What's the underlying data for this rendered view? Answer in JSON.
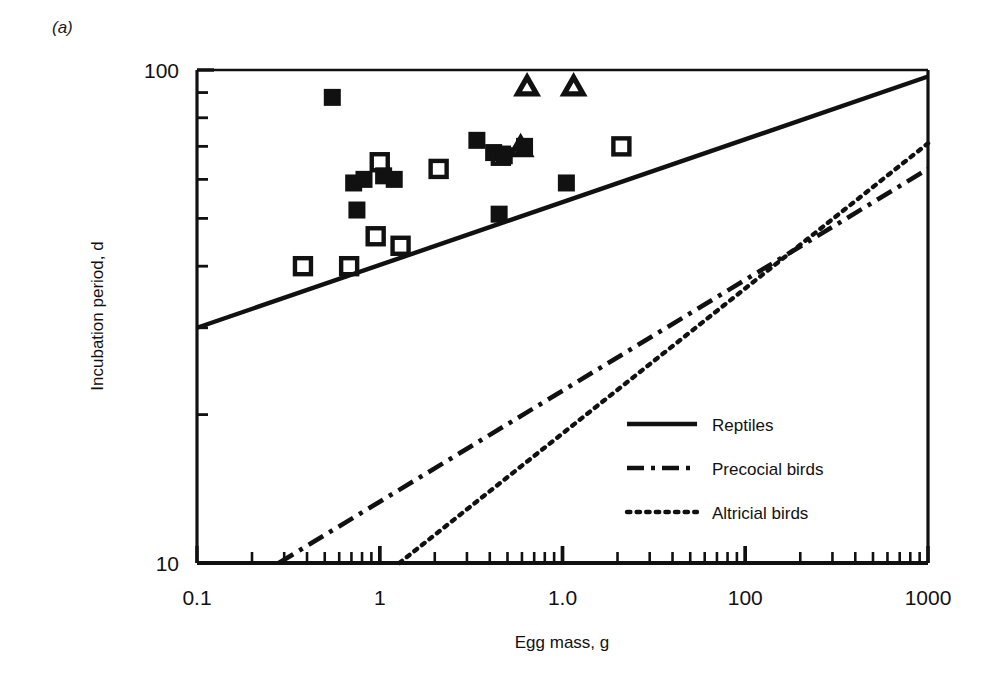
{
  "figure": {
    "panel_label": "(a)",
    "background_color": "#ffffff",
    "ink_color": "#111111"
  },
  "chart_data": {
    "type": "scatter",
    "title": "",
    "subtitle": "",
    "xlabel": "Egg mass, g",
    "ylabel": "Incubation period, d",
    "xscale": "log",
    "yscale": "log",
    "xlim": [
      0.1,
      1000
    ],
    "ylim": [
      10,
      100
    ],
    "grid": false,
    "legend_position": "center-right",
    "xticks": [
      {
        "value": 0.1,
        "label": "0.1"
      },
      {
        "value": 1,
        "label": "1"
      },
      {
        "value": 10,
        "label": "1.0"
      },
      {
        "value": 100,
        "label": "100"
      },
      {
        "value": 1000,
        "label": "1000"
      }
    ],
    "yticks": [
      {
        "value": 10,
        "label": "10"
      },
      {
        "value": 100,
        "label": "100"
      }
    ],
    "series": [
      {
        "name": "Reptiles (filled squares)",
        "marker": "filled-square",
        "points": [
          {
            "x": 0.55,
            "y": 88
          },
          {
            "x": 0.72,
            "y": 59
          },
          {
            "x": 0.82,
            "y": 60
          },
          {
            "x": 1.05,
            "y": 61
          },
          {
            "x": 1.2,
            "y": 60
          },
          {
            "x": 0.75,
            "y": 52
          },
          {
            "x": 3.4,
            "y": 72
          },
          {
            "x": 4.2,
            "y": 68
          },
          {
            "x": 4.8,
            "y": 67
          },
          {
            "x": 6.2,
            "y": 70
          },
          {
            "x": 4.5,
            "y": 51
          },
          {
            "x": 10.5,
            "y": 59
          }
        ]
      },
      {
        "name": "Reptiles (open squares)",
        "marker": "open-square",
        "points": [
          {
            "x": 0.38,
            "y": 40
          },
          {
            "x": 1.0,
            "y": 65
          },
          {
            "x": 2.1,
            "y": 63
          },
          {
            "x": 0.95,
            "y": 46
          },
          {
            "x": 1.3,
            "y": 44
          },
          {
            "x": 0.68,
            "y": 40
          },
          {
            "x": 4.6,
            "y": 67
          },
          {
            "x": 21.0,
            "y": 70
          }
        ]
      },
      {
        "name": "Reptiles (open triangles)",
        "marker": "open-triangle",
        "points": [
          {
            "x": 6.4,
            "y": 93
          },
          {
            "x": 11.5,
            "y": 93
          },
          {
            "x": 5.9,
            "y": 70
          }
        ]
      }
    ],
    "lines": [
      {
        "name": "Reptiles",
        "style": "solid",
        "endpoints": [
          {
            "x": 0.1,
            "y": 30
          },
          {
            "x": 1000,
            "y": 97
          }
        ]
      },
      {
        "name": "Precocial birds",
        "style": "dash-dot",
        "endpoints": [
          {
            "x": 0.28,
            "y": 10
          },
          {
            "x": 1000,
            "y": 63
          }
        ]
      },
      {
        "name": "Altricial birds",
        "style": "dotted",
        "endpoints": [
          {
            "x": 1.28,
            "y": 10
          },
          {
            "x": 1000,
            "y": 71
          }
        ]
      }
    ],
    "legend": [
      {
        "label": "Reptiles",
        "style": "solid"
      },
      {
        "label": "Precocial birds",
        "style": "dash-dot"
      },
      {
        "label": "Altricial birds",
        "style": "dotted"
      }
    ]
  }
}
